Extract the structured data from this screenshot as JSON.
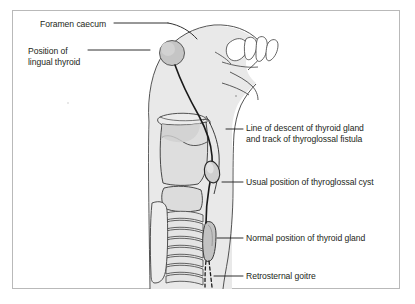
{
  "figure": {
    "frame_color": "#b9b9b9",
    "background_color": "#ffffff",
    "text_color": "#231f20",
    "silhouette_fill": "#e9e9e9",
    "cartilage_fill": "#dcdcdc",
    "gland_fill": "#c9c9c9",
    "outline_color": "#3a3a3a",
    "tract_color": "#1a1a1a"
  },
  "labels": {
    "left": [
      {
        "id": "foramen-caecum",
        "text": "Foramen caecum",
        "x": 40,
        "y": 19
      },
      {
        "id": "lingual-thyroid",
        "line1": "Position of",
        "line2": "lingual thyroid",
        "x": 28,
        "y": 46
      }
    ],
    "right": [
      {
        "id": "line-of-descent",
        "line1": "Line of descent of thyroid gland",
        "line2": "and track of thyroglossal fistula",
        "x": 246,
        "y": 123
      },
      {
        "id": "thyroglossal-cyst",
        "text": "Usual position of thyroglossal cyst",
        "x": 246,
        "y": 177
      },
      {
        "id": "normal-thyroid",
        "text": "Normal position of thyroid gland",
        "x": 246,
        "y": 233
      },
      {
        "id": "retrosternal-goitre",
        "text": "Retrosternal goitre",
        "x": 246,
        "y": 271
      }
    ]
  },
  "anatomy": {
    "parts": [
      "head-silhouette",
      "nasal-cavity",
      "hard-palate",
      "mandible",
      "hyoid-bone",
      "thyroid-cartilage",
      "cricoid-cartilage",
      "tracheal-rings",
      "thyroid-gland",
      "thyroglossal-cyst",
      "lingual-thyroid-circle",
      "descent-tract-line",
      "retrosternal-dashed-line",
      "sternum-manubrium"
    ]
  }
}
